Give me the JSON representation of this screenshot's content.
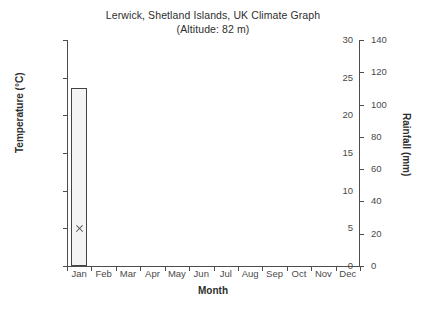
{
  "chart_data": {
    "type": "bar",
    "title": "Lerwick, Shetland Islands, UK Climate Graph",
    "subtitle": "(Altitude: 82 m)",
    "xlabel": "Month",
    "ylabel": "Temperature (°C)",
    "y2label": "Rainfall (mm)",
    "categories": [
      "Jan",
      "Feb",
      "Mar",
      "Apr",
      "May",
      "Jun",
      "Jul",
      "Aug",
      "Sep",
      "Oct",
      "Nov",
      "Dec"
    ],
    "ylim": [
      0,
      30
    ],
    "y2lim": [
      0,
      140
    ],
    "yticks": [
      0,
      5,
      10,
      15,
      20,
      25,
      30
    ],
    "y2ticks": [
      0,
      20,
      40,
      60,
      80,
      100,
      120,
      140
    ],
    "grid": false,
    "legend": "none",
    "series": [
      {
        "name": "Rainfall (mm)",
        "axis": "right",
        "render": "bar",
        "bar_fill": "#f4f4f4",
        "bar_edge": "#444444",
        "values": [
          110,
          null,
          null,
          null,
          null,
          null,
          null,
          null,
          null,
          null,
          null,
          null
        ]
      },
      {
        "name": "Temperature (°C)",
        "axis": "left",
        "render": "cross-marker",
        "marker_color": "#555555",
        "values": [
          5,
          null,
          null,
          null,
          null,
          null,
          null,
          null,
          null,
          null,
          null,
          null
        ]
      }
    ]
  },
  "colors": {
    "background": "#ffffff",
    "axis": "#4d4d4d",
    "text": "#3a3a3a",
    "bar_fill": "#f4f4f4",
    "bar_edge": "#444444",
    "marker": "#555555"
  }
}
